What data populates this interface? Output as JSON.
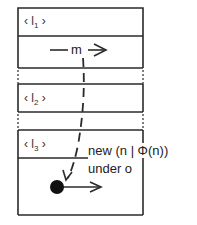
{
  "diagram": {
    "frames": [
      {
        "label_open": "‹ l",
        "label_sub": "1",
        "label_close": " ›"
      },
      {
        "label_open": "‹ l",
        "label_sub": "2",
        "label_close": " ›"
      },
      {
        "label_open": "‹ l",
        "label_sub": "3",
        "label_close": " ›"
      }
    ],
    "message_label": "m",
    "annotation_line1": "new (n | Φ(n))",
    "annotation_line2": "under o",
    "colors": {
      "line": "#2a2a2a",
      "background": "#ffffff"
    }
  }
}
